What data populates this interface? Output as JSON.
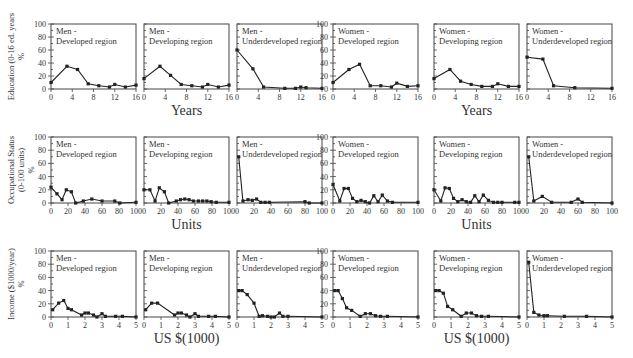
{
  "figure": {
    "row_labels": [
      {
        "line1": "Education (0-16 ed. years",
        "line2": "%"
      },
      {
        "line1": "Occupational Status",
        "line2": "(0-100 units)",
        "line3": "%"
      },
      {
        "line1": "Income  ($1000/year)",
        "line2": "%"
      }
    ],
    "x_axis_titles": [
      {
        "row": 0,
        "cols": [
          1,
          4
        ],
        "text": "Years"
      },
      {
        "row": 1,
        "cols": [
          1,
          4
        ],
        "text": "Units"
      },
      {
        "row": 2,
        "cols": [
          1,
          4
        ],
        "text": "US  $(1000)"
      }
    ],
    "y_ticks": [
      "0",
      "20",
      "40",
      "60",
      "80",
      "100"
    ]
  },
  "chart_data": [
    {
      "type": "line",
      "row": 0,
      "col": 0,
      "title": "Men - Developed region",
      "xlim": [
        0,
        16
      ],
      "ylim": [
        0,
        100
      ],
      "xticks": [
        0,
        4,
        8,
        12,
        16
      ],
      "x": [
        0,
        3,
        5,
        7,
        9,
        11,
        12,
        14,
        16
      ],
      "y": [
        10,
        35,
        30,
        8,
        5,
        3,
        7,
        3,
        6
      ]
    },
    {
      "type": "line",
      "row": 0,
      "col": 1,
      "title": "Men - Developing region",
      "xlim": [
        0,
        16
      ],
      "ylim": [
        0,
        100
      ],
      "xticks": [
        0,
        4,
        8,
        12,
        16
      ],
      "x": [
        0,
        3,
        5,
        7,
        9,
        11,
        12,
        14,
        16
      ],
      "y": [
        16,
        35,
        21,
        7,
        5,
        3,
        7,
        3,
        6
      ]
    },
    {
      "type": "line",
      "row": 0,
      "col": 2,
      "title": "Men - Underdeveloped region",
      "xlim": [
        0,
        16
      ],
      "ylim": [
        0,
        100
      ],
      "xticks": [
        0,
        4,
        8,
        12,
        16
      ],
      "x": [
        0,
        3,
        5,
        9,
        11,
        12,
        13,
        16
      ],
      "y": [
        60,
        31,
        3,
        1,
        1,
        3,
        2,
        1
      ]
    },
    {
      "type": "line",
      "row": 0,
      "col": 3,
      "title": "Women - Developed region",
      "xlim": [
        0,
        16
      ],
      "ylim": [
        0,
        100
      ],
      "xticks": [
        0,
        4,
        8,
        12,
        16
      ],
      "x": [
        0,
        3,
        5,
        7,
        9,
        11,
        12,
        14,
        16
      ],
      "y": [
        10,
        30,
        38,
        5,
        5,
        3,
        9,
        4,
        5
      ]
    },
    {
      "type": "line",
      "row": 0,
      "col": 4,
      "title": "Women - Developing region",
      "xlim": [
        0,
        16
      ],
      "ylim": [
        0,
        100
      ],
      "xticks": [
        0,
        4,
        8,
        12,
        16
      ],
      "x": [
        0,
        3,
        5,
        7,
        9,
        11,
        12,
        14,
        16
      ],
      "y": [
        16,
        30,
        12,
        7,
        4,
        4,
        8,
        4,
        4
      ]
    },
    {
      "type": "line",
      "row": 0,
      "col": 5,
      "title": "Women - Underdeveloped region",
      "xlim": [
        0,
        16
      ],
      "ylim": [
        0,
        100
      ],
      "xticks": [
        0,
        4,
        8,
        12,
        16
      ],
      "x": [
        0,
        3,
        5,
        9,
        16
      ],
      "y": [
        49,
        46,
        5,
        2,
        1
      ]
    },
    {
      "type": "line",
      "row": 1,
      "col": 0,
      "title": "Men - Developed region",
      "xlim": [
        0,
        100
      ],
      "ylim": [
        0,
        100
      ],
      "xticks": [
        0,
        20,
        40,
        60,
        80,
        100
      ],
      "x": [
        0,
        7,
        13,
        18,
        24,
        29,
        38,
        48,
        60,
        75,
        81,
        100
      ],
      "y": [
        24,
        14,
        5,
        20,
        17,
        0,
        3,
        6,
        3,
        3,
        0,
        1
      ]
    },
    {
      "type": "line",
      "row": 1,
      "col": 1,
      "title": "Men - Developing region",
      "xlim": [
        0,
        100
      ],
      "ylim": [
        0,
        100
      ],
      "xticks": [
        0,
        20,
        40,
        60,
        80,
        100
      ],
      "x": [
        0,
        7,
        13,
        18,
        24,
        29,
        38,
        43,
        48,
        53,
        58,
        64,
        69,
        74,
        79,
        85,
        100
      ],
      "y": [
        20,
        20,
        3,
        23,
        17,
        0,
        3,
        5,
        6,
        5,
        3,
        3,
        3,
        3,
        2,
        1,
        1
      ]
    },
    {
      "type": "line",
      "row": 1,
      "col": 2,
      "title": "Men - Underdeveloped region",
      "xlim": [
        0,
        100
      ],
      "ylim": [
        0,
        100
      ],
      "xticks": [
        0,
        20,
        40,
        60,
        80,
        100
      ],
      "x": [
        2,
        7,
        13,
        18,
        23,
        28,
        33,
        38,
        80,
        85,
        100
      ],
      "y": [
        70,
        3,
        5,
        4,
        6,
        1,
        1,
        1,
        2,
        0,
        0
      ]
    },
    {
      "type": "line",
      "row": 1,
      "col": 3,
      "title": "Women - Developed region",
      "xlim": [
        0,
        100
      ],
      "ylim": [
        0,
        100
      ],
      "xticks": [
        0,
        20,
        40,
        60,
        80,
        100
      ],
      "x": [
        0,
        8,
        13,
        18,
        23,
        28,
        33,
        38,
        43,
        48,
        53,
        58,
        64,
        70,
        100
      ],
      "y": [
        28,
        3,
        22,
        22,
        7,
        2,
        4,
        2,
        0,
        11,
        2,
        12,
        3,
        1,
        1
      ]
    },
    {
      "type": "line",
      "row": 1,
      "col": 4,
      "title": "Women - Developing region",
      "xlim": [
        0,
        100
      ],
      "ylim": [
        0,
        100
      ],
      "xticks": [
        0,
        20,
        40,
        60,
        80,
        100
      ],
      "x": [
        0,
        8,
        13,
        18,
        23,
        28,
        33,
        38,
        43,
        48,
        53,
        58,
        64,
        70,
        75,
        80,
        95,
        100
      ],
      "y": [
        20,
        3,
        23,
        22,
        7,
        2,
        5,
        2,
        1,
        11,
        2,
        12,
        4,
        1,
        1,
        1,
        1,
        1
      ]
    },
    {
      "type": "line",
      "row": 1,
      "col": 5,
      "title": "Women - Underdeveloped region",
      "xlim": [
        0,
        100
      ],
      "ylim": [
        0,
        100
      ],
      "xticks": [
        0,
        20,
        40,
        60,
        80,
        100
      ],
      "x": [
        2,
        8,
        18,
        29,
        52,
        60,
        65,
        100
      ],
      "y": [
        70,
        3,
        10,
        1,
        1,
        6,
        1,
        0
      ]
    },
    {
      "type": "line",
      "row": 2,
      "col": 0,
      "title": "Men - Developed region",
      "xlim": [
        0,
        5
      ],
      "ylim": [
        0,
        100
      ],
      "xticks": [
        0,
        1,
        2,
        3,
        4,
        5
      ],
      "x": [
        0.1,
        0.45,
        0.75,
        1.0,
        1.2,
        1.8,
        2.0,
        2.2,
        2.5,
        2.7,
        3.0,
        3.2,
        3.8,
        4.2,
        5.0
      ],
      "y": [
        11,
        21,
        25,
        13,
        11,
        3,
        6,
        6,
        3,
        0,
        5,
        1,
        1,
        1,
        0
      ]
    },
    {
      "type": "line",
      "row": 2,
      "col": 1,
      "title": "Men - Developing region",
      "xlim": [
        0,
        5
      ],
      "ylim": [
        0,
        100
      ],
      "xticks": [
        0,
        1,
        2,
        3,
        4,
        5
      ],
      "x": [
        0.1,
        0.45,
        0.8,
        1.8,
        2.0,
        2.2,
        2.5,
        2.7,
        3.0,
        3.2,
        3.8,
        4.2,
        5.0
      ],
      "y": [
        11,
        21,
        21,
        3,
        6,
        6,
        3,
        0,
        5,
        1,
        1,
        1,
        0
      ]
    },
    {
      "type": "line",
      "row": 2,
      "col": 2,
      "title": "Men - Underdeveloped region",
      "xlim": [
        0,
        5
      ],
      "ylim": [
        0,
        100
      ],
      "xticks": [
        0,
        1,
        2,
        3,
        4,
        5
      ],
      "x": [
        0.1,
        0.3,
        0.6,
        1.0,
        1.3,
        1.5,
        1.8,
        2.0,
        2.2,
        2.5,
        2.7,
        3.0,
        5.0
      ],
      "y": [
        40,
        40,
        34,
        21,
        1,
        2,
        1,
        0,
        0,
        6,
        1,
        1,
        0
      ]
    },
    {
      "type": "line",
      "row": 2,
      "col": 3,
      "title": "Women - Developed region",
      "xlim": [
        0,
        5
      ],
      "ylim": [
        0,
        100
      ],
      "xticks": [
        0,
        1,
        2,
        3,
        4,
        5
      ],
      "x": [
        0.1,
        0.3,
        0.55,
        0.8,
        1.1,
        1.6,
        1.9,
        2.2,
        2.5,
        2.8,
        3.2,
        5.0
      ],
      "y": [
        40,
        40,
        28,
        14,
        10,
        1,
        5,
        5,
        2,
        1,
        1,
        0
      ]
    },
    {
      "type": "line",
      "row": 2,
      "col": 4,
      "title": "Women - Developing region",
      "xlim": [
        0,
        5
      ],
      "ylim": [
        0,
        100
      ],
      "xticks": [
        0,
        1,
        2,
        3,
        4,
        5
      ],
      "x": [
        0.1,
        0.3,
        0.55,
        0.8,
        1.1,
        1.6,
        1.9,
        2.2,
        2.5,
        2.8,
        3.2,
        5.0
      ],
      "y": [
        40,
        40,
        36,
        16,
        11,
        1,
        6,
        6,
        2,
        1,
        1,
        0
      ]
    },
    {
      "type": "line",
      "row": 2,
      "col": 5,
      "title": "Women - Underdeveloped region",
      "xlim": [
        0,
        5
      ],
      "ylim": [
        0,
        100
      ],
      "xticks": [
        0,
        1,
        2,
        3,
        4,
        5
      ],
      "x": [
        0.1,
        0.4,
        0.7,
        1.0,
        1.2,
        2.2,
        3.5,
        5.0
      ],
      "y": [
        83,
        7,
        3,
        2,
        2,
        1,
        1,
        0
      ]
    }
  ]
}
